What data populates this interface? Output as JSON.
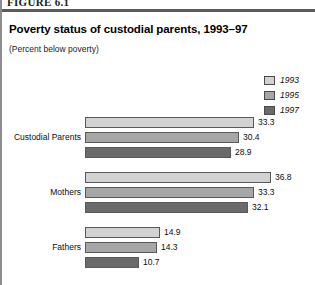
{
  "figure": {
    "label": "FIGURE 6.1",
    "title": "Poverty status of custodial parents, 1993–97",
    "subtitle": "(Percent below poverty)"
  },
  "colors": {
    "series_1993": "#d2d2d2",
    "series_1995": "#a6a6a6",
    "series_1997": "#6a6a6a",
    "bar_outline": "#5a5a5a",
    "rule": "#5c5c5c",
    "left_rule": "#8d8d8d",
    "text": "#0d0d0d"
  },
  "legend": {
    "position": "top-right",
    "items": [
      {
        "label": "1993",
        "color": "#d2d2d2"
      },
      {
        "label": "1995",
        "color": "#a6a6a6"
      },
      {
        "label": "1997",
        "color": "#6a6a6a"
      }
    ]
  },
  "chart_data": {
    "type": "bar",
    "orientation": "horizontal",
    "title": "Poverty status of custodial parents, 1993–97",
    "subtitle": "(Percent below poverty)",
    "xlabel": "",
    "ylabel": "",
    "xlim": [
      0,
      45
    ],
    "grid": false,
    "value_labels": true,
    "legend_position": "top-right",
    "categories": [
      "Custodial Parents",
      "Mothers",
      "Fathers"
    ],
    "series": [
      {
        "name": "1993",
        "color": "#d2d2d2",
        "values": [
          33.3,
          36.8,
          14.9
        ]
      },
      {
        "name": "1995",
        "color": "#a6a6a6",
        "values": [
          30.4,
          33.3,
          14.3
        ]
      },
      {
        "name": "1997",
        "color": "#6a6a6a",
        "values": [
          28.9,
          32.1,
          10.7
        ]
      }
    ],
    "groups": [
      {
        "category": "Custodial Parents",
        "bars": [
          {
            "series": "1993",
            "value": 33.3,
            "label": "33.3",
            "color": "#d2d2d2"
          },
          {
            "series": "1995",
            "value": 30.4,
            "label": "30.4",
            "color": "#a6a6a6"
          },
          {
            "series": "1997",
            "value": 28.9,
            "label": "28.9",
            "color": "#6a6a6a"
          }
        ]
      },
      {
        "category": "Mothers",
        "bars": [
          {
            "series": "1993",
            "value": 36.8,
            "label": "36.8",
            "color": "#d2d2d2"
          },
          {
            "series": "1995",
            "value": 33.3,
            "label": "33.3",
            "color": "#a6a6a6"
          },
          {
            "series": "1997",
            "value": 32.1,
            "label": "32.1",
            "color": "#6a6a6a"
          }
        ]
      },
      {
        "category": "Fathers",
        "bars": [
          {
            "series": "1993",
            "value": 14.9,
            "label": "14.9",
            "color": "#d2d2d2"
          },
          {
            "series": "1995",
            "value": 14.3,
            "label": "14.3",
            "color": "#a6a6a6"
          },
          {
            "series": "1997",
            "value": 10.7,
            "label": "10.7",
            "color": "#6a6a6a"
          }
        ]
      }
    ]
  }
}
